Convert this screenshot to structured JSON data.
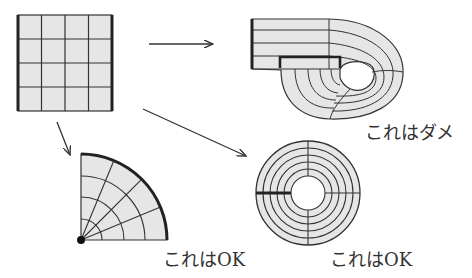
{
  "colors": {
    "fill": "#e6e6e6",
    "line": "#333333",
    "text": "#333333",
    "background": "#ffffff"
  },
  "labels": {
    "bad": "これはダメ",
    "ok_quarter": "これはOK",
    "ok_annulus": "これはOK"
  },
  "figures": {
    "source_grid": {
      "shape": "square",
      "rows": 4,
      "cols": 4,
      "thick_edges": [
        "left",
        "right"
      ]
    },
    "bad_mapping": {
      "shape": "rolled-strip",
      "verdict": "bad"
    },
    "quarter_disk": {
      "shape": "quarter-circle",
      "rings": 4,
      "sectors": 4,
      "thick_edge": "outer-arc",
      "center_point": true,
      "verdict": "ok"
    },
    "annulus": {
      "shape": "annulus",
      "rings": 5,
      "radial_lines": 4,
      "thick_seam": "left",
      "verdict": "ok"
    }
  },
  "arrows": [
    {
      "from": "source_grid",
      "to": "bad_mapping",
      "direction": "right"
    },
    {
      "from": "source_grid",
      "to": "annulus",
      "direction": "down-right"
    },
    {
      "from": "source_grid",
      "to": "quarter_disk",
      "direction": "down"
    }
  ]
}
